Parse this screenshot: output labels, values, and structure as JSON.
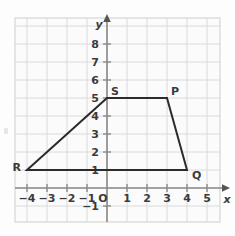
{
  "figure": {
    "type": "coordinate-plane-polygon",
    "axis_labels": {
      "x": "x",
      "y": "y",
      "origin": "O"
    },
    "x_ticks": [
      {
        "value": -4,
        "label": "−4"
      },
      {
        "value": -3,
        "label": "−3"
      },
      {
        "value": -2,
        "label": "−2"
      },
      {
        "value": -1,
        "label": "−1"
      },
      {
        "value": 1,
        "label": "1"
      },
      {
        "value": 2,
        "label": "2"
      },
      {
        "value": 3,
        "label": "3"
      },
      {
        "value": 4,
        "label": "4"
      },
      {
        "value": 5,
        "label": "5"
      }
    ],
    "y_ticks": [
      {
        "value": -1,
        "label": "−1"
      },
      {
        "value": 1,
        "label": "1"
      },
      {
        "value": 2,
        "label": "2"
      },
      {
        "value": 3,
        "label": "3"
      },
      {
        "value": 4,
        "label": "4"
      },
      {
        "value": 5,
        "label": "5"
      },
      {
        "value": 6,
        "label": "6"
      },
      {
        "value": 7,
        "label": "7"
      },
      {
        "value": 8,
        "label": "8"
      }
    ],
    "xlim": [
      -5,
      6
    ],
    "ylim": [
      -2,
      9
    ],
    "grid": true,
    "vertices": [
      {
        "label": "S",
        "x": 0,
        "y": 5,
        "label_dx": 4,
        "label_dy": -3
      },
      {
        "label": "P",
        "x": 3,
        "y": 5,
        "label_dx": 4,
        "label_dy": -3
      },
      {
        "label": "Q",
        "x": 4,
        "y": 1,
        "label_dx": 5,
        "label_dy": 9
      },
      {
        "label": "R",
        "x": -4,
        "y": 1,
        "label_dx": -13,
        "label_dy": 1
      }
    ],
    "polygon_order": [
      "S",
      "P",
      "Q",
      "R"
    ],
    "colors": {
      "grid": "#d8d8d8",
      "axis": "#8a8a8a",
      "shape": "#2b2b2b",
      "text": "#3a3a3a",
      "background": "#fdfdfd"
    }
  }
}
